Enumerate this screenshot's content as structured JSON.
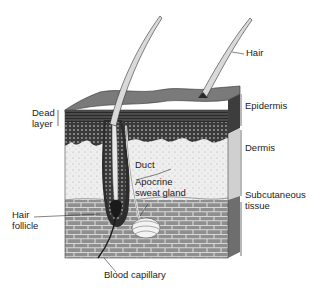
{
  "diagram": {
    "colors": {
      "background": "#ffffff",
      "label_text": "#222222",
      "epidermis": "#5a5a5a",
      "epidermis_top": "#7a7a7a",
      "dermis": "#ebebeb",
      "subcutaneous": "#8f8f8f",
      "mortar": "#d8d8d8",
      "hair": "#d9d9d9",
      "hair_outline": "#333333"
    },
    "labels": {
      "hair": "Hair",
      "epidermis": "Epidermis",
      "dermis": "Dermis",
      "subcutaneous": "Subcutaneous\ntissue",
      "dead_layer": "Dead\nlayer",
      "duct": "Duct",
      "apocrine": "Apocrine\nsweat gland",
      "hair_follicle": "Hair\nfollicle",
      "blood_capillary": "Blood capillary"
    }
  }
}
